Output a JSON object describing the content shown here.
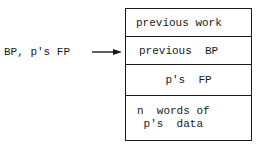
{
  "diagram": {
    "pointer_label": "BP, p's FP",
    "arrow": "right-arrow",
    "stack_cells": [
      {
        "label": "previous work"
      },
      {
        "label": "previous  BP"
      },
      {
        "label": "p's  FP"
      },
      {
        "label": "n  words of\n p's  data"
      }
    ]
  }
}
